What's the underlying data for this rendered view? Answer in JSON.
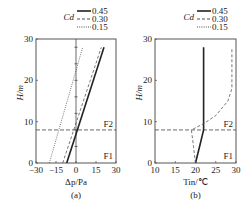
{
  "chart_data": [
    {
      "type": "line",
      "panel_label": "(a)",
      "xlabel": "Δp/Pa",
      "ylabel": "H/m",
      "xlim": [
        -30,
        30
      ],
      "ylim": [
        0,
        30
      ],
      "xticks": [
        "-30",
        "-15",
        "0",
        "15",
        "30"
      ],
      "yticks": [
        "0",
        "10",
        "20",
        "30"
      ],
      "legend_title": "Cd",
      "legend_position": "top-right",
      "annotations": [
        "F2",
        "F1"
      ],
      "floor_boundary_height": 8,
      "series": [
        {
          "name": "0.45",
          "style": "solid",
          "x": [
            -7,
            21
          ],
          "y": [
            0,
            28
          ]
        },
        {
          "name": "0.30",
          "style": "dashed",
          "x": [
            -10,
            19
          ],
          "y": [
            0,
            28
          ]
        },
        {
          "name": "0.15",
          "style": "dotted",
          "x": [
            -20,
            5
          ],
          "y": [
            0,
            28
          ]
        }
      ]
    },
    {
      "type": "line",
      "panel_label": "(b)",
      "xlabel": "Tin/℃",
      "ylabel": "H/m",
      "xlim": [
        10,
        30
      ],
      "ylim": [
        0,
        30
      ],
      "xticks": [
        "10",
        "15",
        "20",
        "25",
        "30"
      ],
      "yticks": [
        "0",
        "10",
        "20",
        "30"
      ],
      "legend_title": "Cd",
      "legend_position": "top-right",
      "annotations": [
        "F2",
        "F1"
      ],
      "floor_boundary_height": 8,
      "series": [
        {
          "name": "0.45",
          "style": "solid",
          "x": [
            20,
            21,
            22,
            22,
            22
          ],
          "y": [
            0,
            4,
            8,
            18,
            28
          ]
        },
        {
          "name": "0.30",
          "style": "dashed",
          "x": [
            20,
            19.5,
            19,
            22,
            25,
            28,
            29,
            29
          ],
          "y": [
            0,
            4,
            8,
            9.5,
            11.5,
            15,
            18,
            28
          ]
        }
      ]
    }
  ]
}
